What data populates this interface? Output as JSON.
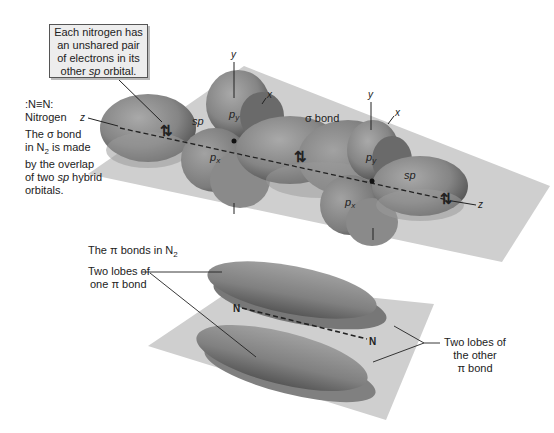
{
  "callout": {
    "line1": "Each nitrogen has",
    "line2": "an unshared pair",
    "line3": "of electrons in its",
    "line4_pre": "other ",
    "line4_it": "sp",
    "line4_post": " orbital."
  },
  "left_notes": {
    "structure": ":N≡N:",
    "name": "Nitrogen",
    "sigma_1": "The σ bond",
    "sigma_2_pre": "in N",
    "sigma_2_sub": "2",
    "sigma_2_post": " is made",
    "sigma_3": "by the overlap",
    "sigma_4_pre": "of two ",
    "sigma_4_it": "sp",
    "sigma_4_post": " hybrid",
    "sigma_5": "orbitals."
  },
  "sigma_diagram": {
    "sigma_bond_label": "σ bond",
    "left_atom": {
      "sp_label": "sp",
      "py_label": "p",
      "py_sub": "y",
      "px_label": "p",
      "px_sub": "x",
      "axis_y": "y",
      "axis_x": "x",
      "axis_z": "z"
    },
    "right_atom": {
      "sp_label": "sp",
      "py_label": "p",
      "py_sub": "y",
      "px_label": "p",
      "px_sub": "x",
      "axis_y": "y",
      "axis_x": "x",
      "axis_z": "z"
    },
    "electron_pair_glyph": "⇅"
  },
  "pi_diagram": {
    "title_pre": "The π bonds in N",
    "title_sub": "2",
    "label_one_1": "Two lobes of",
    "label_one_2": "one π bond",
    "label_other_1": "Two lobes of",
    "label_other_2": "the other",
    "label_other_3": "π bond",
    "atom_left": "N",
    "atom_right": "N"
  },
  "colors": {
    "plane": "#cfcfcf",
    "lobe": "#8e8e8e",
    "lobe_dark": "#5e5e5e",
    "text": "#222222",
    "callout_bg": "#ededed"
  }
}
